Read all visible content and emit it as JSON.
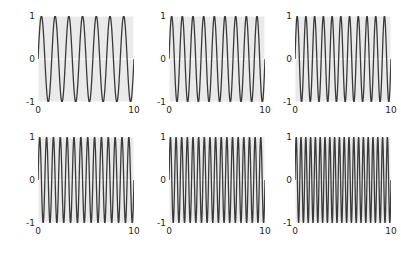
{
  "figure": {
    "width": 401,
    "height": 261,
    "background": "#ffffff",
    "axes_facecolor": "#eaeaea",
    "grid_color": "#ffffff",
    "line_color": "#3a3a3a",
    "tick_label_color": "#262626",
    "rows": 2,
    "cols": 3
  },
  "chart_data": [
    {
      "type": "line",
      "title": "",
      "xlabel": "",
      "ylabel": "",
      "xlim": [
        0,
        10
      ],
      "ylim": [
        -1,
        1
      ],
      "xticks": [
        0,
        10
      ],
      "xticklabels": [
        "0",
        "10"
      ],
      "yticks": [
        -1,
        0,
        1
      ],
      "yticklabels": [
        "-1",
        "0",
        "1"
      ],
      "grid": true,
      "series": [
        {
          "name": "sine",
          "function": "sin",
          "amplitude": 1,
          "frequency_cycles_over_range": 7,
          "phase": 0,
          "color": "#3a3a3a"
        }
      ]
    },
    {
      "type": "line",
      "title": "",
      "xlabel": "",
      "ylabel": "",
      "xlim": [
        0,
        10
      ],
      "ylim": [
        -1,
        1
      ],
      "xticks": [
        0,
        10
      ],
      "xticklabels": [
        "0",
        "10"
      ],
      "yticks": [
        -1,
        0,
        1
      ],
      "yticklabels": [
        "-1",
        "0",
        "1"
      ],
      "grid": true,
      "series": [
        {
          "name": "sine",
          "function": "sin",
          "amplitude": 1,
          "frequency_cycles_over_range": 9,
          "phase": 0,
          "color": "#3a3a3a"
        }
      ]
    },
    {
      "type": "line",
      "title": "",
      "xlabel": "",
      "ylabel": "",
      "xlim": [
        0,
        10
      ],
      "ylim": [
        -1,
        1
      ],
      "xticks": [
        0,
        10
      ],
      "xticklabels": [
        "0",
        "10"
      ],
      "yticks": [
        -1,
        0,
        1
      ],
      "yticklabels": [
        "-1",
        "0",
        "1"
      ],
      "grid": true,
      "series": [
        {
          "name": "sine",
          "function": "sin",
          "amplitude": 1,
          "frequency_cycles_over_range": 11,
          "phase": 0,
          "color": "#3a3a3a"
        }
      ]
    },
    {
      "type": "line",
      "title": "",
      "xlabel": "",
      "ylabel": "",
      "xlim": [
        0,
        10
      ],
      "ylim": [
        -1,
        1
      ],
      "xticks": [
        0,
        10
      ],
      "xticklabels": [
        "0",
        "10"
      ],
      "yticks": [
        -1,
        0,
        1
      ],
      "yticklabels": [
        "-1",
        "0",
        "1"
      ],
      "grid": true,
      "series": [
        {
          "name": "sine",
          "function": "sin",
          "amplitude": 1,
          "frequency_cycles_over_range": 14,
          "phase": 0,
          "color": "#3a3a3a"
        }
      ]
    },
    {
      "type": "line",
      "title": "",
      "xlabel": "",
      "ylabel": "",
      "xlim": [
        0,
        10
      ],
      "ylim": [
        -1,
        1
      ],
      "xticks": [
        0,
        10
      ],
      "xticklabels": [
        "0",
        "10"
      ],
      "yticks": [
        -1,
        0,
        1
      ],
      "yticklabels": [
        "-1",
        "0",
        "1"
      ],
      "grid": true,
      "series": [
        {
          "name": "sine",
          "function": "sin",
          "amplitude": 1,
          "frequency_cycles_over_range": 17,
          "phase": 0,
          "color": "#3a3a3a"
        }
      ]
    },
    {
      "type": "line",
      "title": "",
      "xlabel": "",
      "ylabel": "",
      "xlim": [
        0,
        10
      ],
      "ylim": [
        -1,
        1
      ],
      "xticks": [
        0,
        10
      ],
      "xticklabels": [
        "0",
        "10"
      ],
      "yticks": [
        -1,
        0,
        1
      ],
      "yticklabels": [
        "-1",
        "0",
        "1"
      ],
      "grid": true,
      "series": [
        {
          "name": "sine",
          "function": "sin",
          "amplitude": 1,
          "frequency_cycles_over_range": 20,
          "phase": 0,
          "color": "#3a3a3a"
        }
      ]
    }
  ],
  "layout": {
    "panels": [
      {
        "left": 38,
        "top": 16,
        "width": 96,
        "height": 86
      },
      {
        "left": 169,
        "top": 16,
        "width": 96,
        "height": 86
      },
      {
        "left": 295,
        "top": 16,
        "width": 96,
        "height": 86
      },
      {
        "left": 38,
        "top": 137,
        "width": 96,
        "height": 86
      },
      {
        "left": 169,
        "top": 137,
        "width": 96,
        "height": 86
      },
      {
        "left": 295,
        "top": 137,
        "width": 96,
        "height": 86
      }
    ]
  }
}
